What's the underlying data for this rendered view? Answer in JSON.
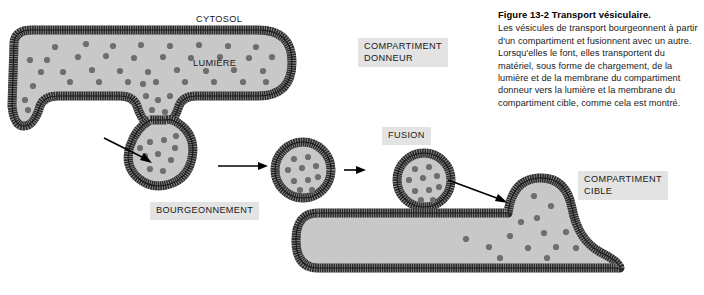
{
  "figure": {
    "caption_title": "Figure 13-2 Transport vésiculaire.",
    "caption_body": "Les vésicules de transport bourgeonnent à partir d'un compartiment et fusionnent avec un autre. Lorsqu'elles le font, elles transportent du matériel, sous forme de chargement, de la lumière et de la membrane du compartiment donneur vers la lumière et la membrane du compartiment cible, comme cela est montré."
  },
  "labels": {
    "cytosol": "CYTOSOL",
    "lumiere": "LUMIÈRE",
    "donor_compartment": "COMPARTIMENT\nDONNEUR",
    "budding": "BOURGEONNEMENT",
    "fusion": "FUSION",
    "target_compartment": "COMPARTIMENT\nCIBLE"
  },
  "colors": {
    "lumen_fill": "#c8c8c8",
    "membrane_dark": "#2b2b2b",
    "cargo_dot": "#6e6e6e",
    "label_box": "#e3e3e3",
    "background": "#ffffff",
    "arrow": "#000000"
  },
  "diagram": {
    "type": "cell-biology-schematic",
    "stages": [
      "donor-compartment",
      "budding-vesicle",
      "free-vesicle",
      "fusing-vesicle",
      "target-compartment"
    ],
    "cargo_dot_count_donor": 44,
    "cargo_dot_count_vesicle": 10,
    "cargo_dot_count_target": 14,
    "arrow_count": 4
  }
}
